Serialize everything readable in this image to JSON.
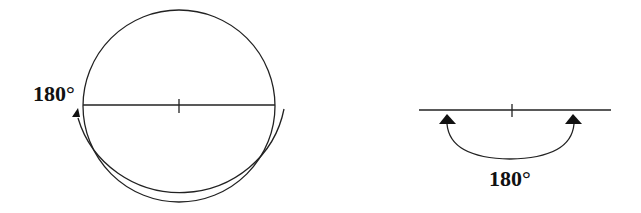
{
  "figure": {
    "left_panel": {
      "description": "Full circle with diameter and center tick; curved arrow around lower half indicating 180 degree rotation",
      "angle_label": "180°"
    },
    "right_panel": {
      "description": "Straight line with center tick; arc arrow below connecting two arrowheads indicating 180 degree straight angle",
      "angle_label": "180°"
    },
    "stroke_color": "#222222"
  }
}
